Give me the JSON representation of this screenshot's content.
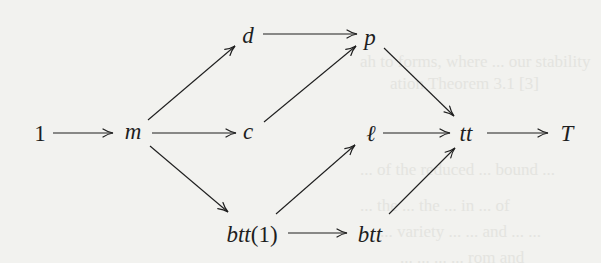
{
  "diagram": {
    "type": "commutative-diagram",
    "background": "#f2f2ef",
    "ink_color": "#1e1e1e",
    "nodes": [
      {
        "id": "one",
        "label": "1",
        "x": 40,
        "y": 133,
        "italic": false
      },
      {
        "id": "m",
        "label": "m",
        "x": 133,
        "y": 133,
        "italic": true
      },
      {
        "id": "d",
        "label": "d",
        "x": 248,
        "y": 35,
        "italic": true
      },
      {
        "id": "c",
        "label": "c",
        "x": 248,
        "y": 133,
        "italic": true
      },
      {
        "id": "btt1",
        "label_main": "btt",
        "label_arg": "(1)",
        "x": 252,
        "y": 234,
        "italic": true
      },
      {
        "id": "p",
        "label": "p",
        "x": 370,
        "y": 38,
        "italic": true
      },
      {
        "id": "ell",
        "label": "ℓ",
        "x": 371,
        "y": 133,
        "italic": true
      },
      {
        "id": "btt",
        "label": "btt",
        "x": 370,
        "y": 234,
        "italic": true
      },
      {
        "id": "tt",
        "label": "tt",
        "x": 466,
        "y": 133,
        "italic": true
      },
      {
        "id": "T",
        "label": "T",
        "x": 567,
        "y": 133,
        "italic": true
      }
    ],
    "edges": [
      {
        "from": "1",
        "to": "m",
        "x1": 53,
        "y1": 133,
        "x2": 113,
        "y2": 133
      },
      {
        "from": "m",
        "to": "d",
        "x1": 148,
        "y1": 120,
        "x2": 235,
        "y2": 46
      },
      {
        "from": "m",
        "to": "c",
        "x1": 152,
        "y1": 133,
        "x2": 236,
        "y2": 133
      },
      {
        "from": "m",
        "to": "btt(1)",
        "x1": 150,
        "y1": 146,
        "x2": 228,
        "y2": 212
      },
      {
        "from": "d",
        "to": "p",
        "x1": 263,
        "y1": 34,
        "x2": 357,
        "y2": 34
      },
      {
        "from": "c",
        "to": "p",
        "x1": 264,
        "y1": 122,
        "x2": 356,
        "y2": 46
      },
      {
        "from": "c",
        "to": "ℓ",
        "x1": 264,
        "y1": 133,
        "x2": 264,
        "y2": 133,
        "hidden": true
      },
      {
        "from": "btt(1)",
        "to": "ℓ",
        "x1": 276,
        "y1": 214,
        "x2": 355,
        "y2": 145
      },
      {
        "from": "btt(1)",
        "to": "btt",
        "x1": 288,
        "y1": 233,
        "x2": 347,
        "y2": 233
      },
      {
        "from": "p",
        "to": "tt",
        "x1": 384,
        "y1": 48,
        "x2": 454,
        "y2": 116
      },
      {
        "from": "ℓ",
        "to": "tt",
        "x1": 383,
        "y1": 133,
        "x2": 450,
        "y2": 133
      },
      {
        "from": "btt",
        "to": "tt",
        "x1": 389,
        "y1": 214,
        "x2": 455,
        "y2": 148
      },
      {
        "from": "tt",
        "to": "T",
        "x1": 487,
        "y1": 133,
        "x2": 548,
        "y2": 133
      }
    ]
  },
  "bleed_through": [
    {
      "text": "ah to forms, where ... our stability",
      "x": 360,
      "y": 52
    },
    {
      "text": "ation  Theorem 3.1 [3]",
      "x": 390,
      "y": 74
    },
    {
      "text": "... of the reduced ... bound ...",
      "x": 360,
      "y": 160
    },
    {
      "text": "... the ... the ... in ... of",
      "x": 360,
      "y": 196
    },
    {
      "text": "... variety ... ... and ... ...",
      "x": 380,
      "y": 222
    },
    {
      "text": "... ... ... ... rom and",
      "x": 400,
      "y": 248
    }
  ]
}
